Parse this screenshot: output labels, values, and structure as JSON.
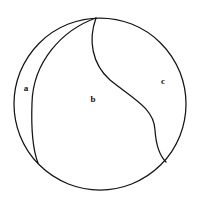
{
  "figure": {
    "background_color": "#ffffff",
    "stroke_color": "#141414",
    "label_color": "#111111",
    "canvas": {
      "width": 200,
      "height": 208
    }
  },
  "chart_data": {
    "type": "diagram",
    "title": "",
    "shapes": [
      {
        "name": "outer-circle",
        "kind": "circle",
        "center": [
          100,
          104
        ],
        "radius": 86,
        "fill": "#ffffff",
        "stroke": "#141414"
      },
      {
        "name": "left-arc",
        "kind": "curve",
        "start": [
          96,
          18
        ],
        "end": [
          38,
          163
        ],
        "bulge_direction": "left",
        "extreme_point": [
          32,
          100
        ],
        "path": "M 96 18 C 62 30, 33 62, 32 103 C 31 130, 33 150, 38 163"
      },
      {
        "name": "s-curve",
        "kind": "curve",
        "start": [
          96,
          18
        ],
        "end": [
          166,
          162
        ],
        "inflection_point": [
          120,
          85
        ],
        "path": "M 96 18 C 88 40, 92 64, 110 80 C 132 98, 154 108, 155 130 C 156 146, 160 156, 166 162"
      }
    ],
    "labels": [
      {
        "text": "a",
        "x": 26,
        "y": 89,
        "region": "left-crescent"
      },
      {
        "text": "b",
        "x": 93,
        "y": 100,
        "region": "center-region"
      },
      {
        "text": "c",
        "x": 163,
        "y": 82,
        "region": "right-region"
      }
    ],
    "regions": [
      {
        "id": "a",
        "label": "a",
        "description": "narrow crescent between circle edge and left arc"
      },
      {
        "id": "b",
        "label": "b",
        "description": "large central region between left arc and s-curve"
      },
      {
        "id": "c",
        "label": "c",
        "description": "right region between s-curve and circle edge"
      }
    ],
    "grid": false,
    "legend": false
  }
}
